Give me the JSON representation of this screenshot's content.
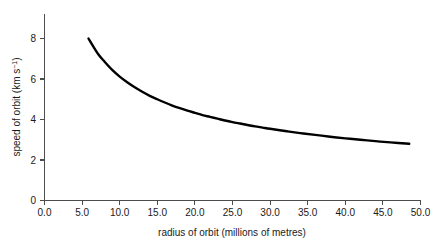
{
  "chart_data": {
    "type": "line",
    "title": "",
    "xlabel": "radius of orbit (millions of metres)",
    "ylabel": "speed of orbit (km s−1)",
    "ylabel_parts": {
      "main": "speed of orbit (km s",
      "exponent": "−1",
      "tail": ")"
    },
    "xlim": [
      0.0,
      50.0
    ],
    "ylim": [
      0,
      8.8
    ],
    "xticks": [
      0.0,
      5.0,
      10.0,
      15.0,
      20.0,
      25.0,
      30.0,
      35.0,
      40.0,
      45.0,
      50.0
    ],
    "xtick_labels": [
      "0.0",
      "5.0",
      "10.0",
      "15.0",
      "20.0",
      "25.0",
      "30.0",
      "35.0",
      "40.0",
      "45.0",
      "50.0"
    ],
    "yticks": [
      0,
      2,
      4,
      6,
      8
    ],
    "ytick_labels": [
      "0",
      "2",
      "4",
      "6",
      "8"
    ],
    "grid": false,
    "legend": null,
    "series": [
      {
        "name": "orbital speed vs radius",
        "color": "#000000",
        "relation": "v = k / sqrt(r), k ≈ 20.9",
        "x": [
          5.85,
          6.5,
          7.2,
          8.0,
          9.0,
          10.0,
          11.0,
          12.0,
          13.0,
          14.0,
          15.0,
          16.0,
          17.0,
          18.0,
          19.0,
          20.0,
          21.0,
          22.0,
          23.0,
          24.0,
          25.0,
          26.0,
          27.0,
          28.0,
          29.0,
          30.0,
          32.0,
          34.0,
          36.0,
          38.0,
          40.0,
          42.0,
          44.0,
          46.0,
          48.5
        ],
        "y": [
          8.0,
          7.6,
          7.2,
          6.85,
          6.45,
          6.12,
          5.84,
          5.59,
          5.37,
          5.17,
          5.0,
          4.84,
          4.69,
          4.56,
          4.44,
          4.33,
          4.22,
          4.13,
          4.04,
          3.95,
          3.87,
          3.8,
          3.73,
          3.66,
          3.6,
          3.54,
          3.43,
          3.33,
          3.24,
          3.15,
          3.07,
          3.0,
          2.93,
          2.87,
          2.8
        ]
      }
    ],
    "annotations": []
  }
}
